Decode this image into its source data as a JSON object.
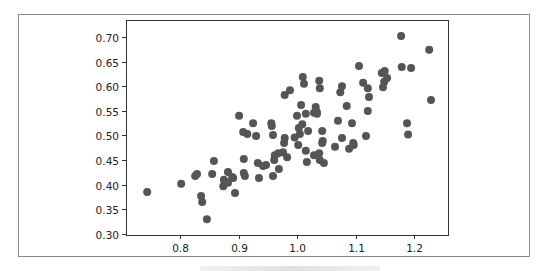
{
  "chart_data": {
    "type": "scatter",
    "title": "",
    "xlabel": "",
    "ylabel": "",
    "xlim": [
      0.72,
      1.25
    ],
    "ylim": [
      0.295,
      0.73
    ],
    "xticks": [
      0.8,
      0.9,
      1.0,
      1.1,
      1.2
    ],
    "xtick_labels": [
      "0.8",
      "0.9",
      "1.0",
      "1.1",
      "1.2"
    ],
    "yticks": [
      0.3,
      0.35,
      0.4,
      0.45,
      0.5,
      0.55,
      0.6,
      0.65,
      0.7
    ],
    "ytick_labels": [
      "0.30",
      "0.35",
      "0.40",
      "0.45",
      "0.50",
      "0.55",
      "0.60",
      "0.65",
      "0.70"
    ],
    "grid": false,
    "legend": null,
    "marker_color": "#555555",
    "points": [
      [
        0.744,
        0.385
      ],
      [
        0.802,
        0.402
      ],
      [
        0.826,
        0.418
      ],
      [
        0.829,
        0.422
      ],
      [
        0.858,
        0.448
      ],
      [
        0.855,
        0.422
      ],
      [
        0.836,
        0.377
      ],
      [
        0.838,
        0.365
      ],
      [
        0.846,
        0.33
      ],
      [
        0.882,
        0.426
      ],
      [
        0.875,
        0.41
      ],
      [
        0.874,
        0.397
      ],
      [
        0.882,
        0.404
      ],
      [
        0.891,
        0.414
      ],
      [
        0.894,
        0.383
      ],
      [
        0.909,
        0.452
      ],
      [
        0.909,
        0.424
      ],
      [
        0.911,
        0.418
      ],
      [
        0.889,
        0.416
      ],
      [
        0.901,
        0.54
      ],
      [
        0.925,
        0.525
      ],
      [
        0.908,
        0.507
      ],
      [
        0.915,
        0.503
      ],
      [
        0.93,
        0.499
      ],
      [
        0.956,
        0.525
      ],
      [
        0.957,
        0.519
      ],
      [
        0.959,
        0.501
      ],
      [
        1.0,
        0.54
      ],
      [
        1.015,
        0.544
      ],
      [
        1.032,
        0.548
      ],
      [
        1.034,
        0.544
      ],
      [
        1.009,
        0.523
      ],
      [
        1.003,
        0.515
      ],
      [
        1.019,
        0.509
      ],
      [
        1.005,
        0.503
      ],
      [
        0.996,
        0.496
      ],
      [
        0.979,
        0.495
      ],
      [
        0.978,
        0.485
      ],
      [
        1.002,
        0.481
      ],
      [
        1.043,
        0.509
      ],
      [
        1.044,
        0.489
      ],
      [
        1.043,
        0.485
      ],
      [
        0.962,
        0.46
      ],
      [
        0.968,
        0.464
      ],
      [
        0.976,
        0.466
      ],
      [
        0.961,
        0.45
      ],
      [
        0.983,
        0.456
      ],
      [
        1.015,
        0.469
      ],
      [
        1.017,
        0.446
      ],
      [
        1.029,
        0.46
      ],
      [
        1.038,
        0.464
      ],
      [
        1.039,
        0.45
      ],
      [
        1.046,
        0.444
      ],
      [
        0.933,
        0.444
      ],
      [
        0.942,
        0.438
      ],
      [
        0.947,
        0.44
      ],
      [
        0.969,
        0.432
      ],
      [
        0.959,
        0.418
      ],
      [
        0.935,
        0.414
      ],
      [
        1.01,
        0.619
      ],
      [
        1.012,
        0.605
      ],
      [
        1.038,
        0.611
      ],
      [
        1.039,
        0.596
      ],
      [
        0.988,
        0.592
      ],
      [
        0.979,
        0.582
      ],
      [
        1.077,
        0.6
      ],
      [
        1.074,
        0.588
      ],
      [
        1.007,
        0.562
      ],
      [
        1.032,
        0.558
      ],
      [
        1.034,
        0.548
      ],
      [
        1.029,
        0.546
      ],
      [
        1.085,
        0.56
      ],
      [
        1.07,
        0.53
      ],
      [
        1.106,
        0.641
      ],
      [
        1.113,
        0.607
      ],
      [
        1.121,
        0.596
      ],
      [
        1.123,
        0.578
      ],
      [
        1.121,
        0.55
      ],
      [
        1.178,
        0.702
      ],
      [
        1.226,
        0.674
      ],
      [
        1.179,
        0.639
      ],
      [
        1.195,
        0.637
      ],
      [
        1.15,
        0.631
      ],
      [
        1.145,
        0.627
      ],
      [
        1.154,
        0.617
      ],
      [
        1.149,
        0.609
      ],
      [
        1.147,
        0.598
      ],
      [
        1.229,
        0.572
      ],
      [
        1.188,
        0.525
      ],
      [
        1.19,
        0.502
      ],
      [
        1.118,
        0.499
      ],
      [
        1.094,
        0.525
      ],
      [
        1.077,
        0.495
      ],
      [
        1.096,
        0.485
      ],
      [
        1.097,
        0.481
      ],
      [
        1.065,
        0.477
      ],
      [
        1.089,
        0.473
      ]
    ]
  },
  "layout": {
    "plot_px": {
      "left": 126,
      "top": 20,
      "right": 448,
      "bottom": 235
    },
    "x_map": {
      "v0": 0.8,
      "px0": 180,
      "px_per_unit": 585
    },
    "y_map": {
      "v0": 0.7,
      "px0": 37,
      "px_per_unit": 492.5
    }
  }
}
